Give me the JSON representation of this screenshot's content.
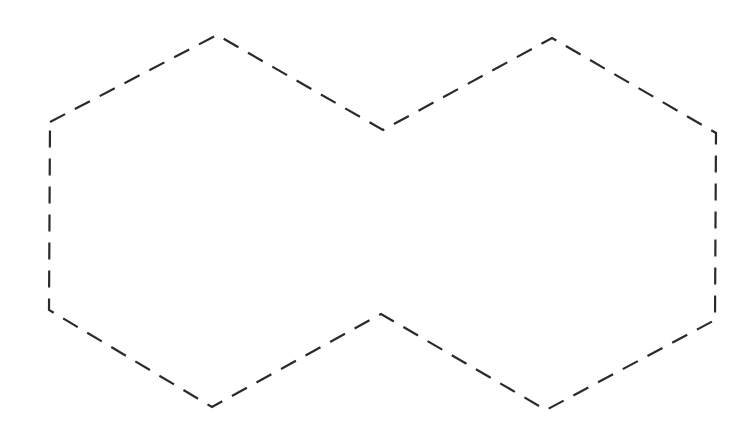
{
  "diagram": {
    "shape": "fused-hexagons-outline",
    "canvas": {
      "width": 747,
      "height": 430,
      "background": "#ffffff"
    },
    "stroke": {
      "color": "#2a2a2a",
      "width": 2.2,
      "dasharray": "17 11"
    },
    "outline_points": [
      [
        50,
        122
      ],
      [
        217,
        35
      ],
      [
        383,
        130
      ],
      [
        552,
        38
      ],
      [
        716,
        133
      ],
      [
        715,
        320
      ],
      [
        546,
        410
      ],
      [
        381,
        314
      ],
      [
        212,
        407
      ],
      [
        49,
        310
      ]
    ]
  }
}
